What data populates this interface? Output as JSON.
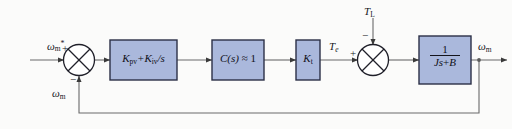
{
  "diagram": {
    "background_color": "#fbfbfa",
    "block_fill": "#aab8dc",
    "block_stroke": "#2b2f46",
    "line_color": "#5c5c5c",
    "blocks": [
      {
        "id": "pi",
        "label_plain": "Kpv + Kiv/s",
        "k1": "K",
        "sub1": "pv",
        "op": "+",
        "k2": "K",
        "sub2": "iv",
        "tail": "/s"
      },
      {
        "id": "conv",
        "label_plain": "C(s) ≈ 1",
        "c": "C",
        "arg": "(s)",
        "approx": "≈",
        "one": "1"
      },
      {
        "id": "kt",
        "label_plain": "Kt",
        "k": "K",
        "sub": "t"
      },
      {
        "id": "plant",
        "label_plain": "1/(Js+B)",
        "numerator": "1",
        "denominator": "Js + B",
        "den_j": "J",
        "den_s": "s",
        "den_plus": "+",
        "den_b": "B"
      }
    ],
    "signals": {
      "reference": {
        "base": "ω",
        "sub": "m",
        "sup": "*"
      },
      "feedback": {
        "base": "ω",
        "sub": "m"
      },
      "torque_e": {
        "base": "T",
        "sub": "e"
      },
      "torque_load": {
        "base": "T",
        "sub": "L"
      },
      "output": {
        "base": "ω",
        "sub": "m"
      }
    },
    "summing_junctions": [
      {
        "id": "speed-error",
        "inputs": [
          {
            "port": "left",
            "sign": "+"
          },
          {
            "port": "bottom",
            "sign": "−"
          }
        ]
      },
      {
        "id": "torque-sum",
        "inputs": [
          {
            "port": "left",
            "sign": "+"
          },
          {
            "port": "top",
            "sign": "−"
          }
        ]
      }
    ]
  }
}
